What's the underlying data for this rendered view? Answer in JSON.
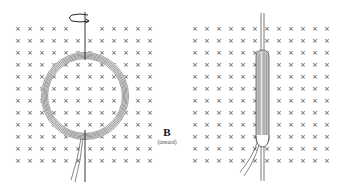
{
  "field": {
    "symbol": "B",
    "direction_label": "(inward)",
    "mark_glyph": "×",
    "mark_color": "#444444"
  },
  "left_panel": {
    "description": "circular coil face-on in field, rotating about vertical axis",
    "grid": {
      "cols": 12,
      "rows": 12,
      "x0": 18,
      "y0": 28,
      "dx": 12,
      "dy": 12
    },
    "coil": {
      "cx": 85,
      "cy": 96,
      "r_outer": 43,
      "r_inner": 38
    },
    "rotation_arrow_icon": "rotation-arrow-icon"
  },
  "right_panel": {
    "description": "same coil edge-on after 90 degree rotation",
    "grid": {
      "cols": 12,
      "rows": 12,
      "x0": 195,
      "y0": 28,
      "dx": 12,
      "dy": 12
    },
    "coil_edge": {
      "x": 262,
      "y_top": 50,
      "y_bottom": 145
    }
  },
  "colors": {
    "line": "#333333",
    "coil_fill": "#bdbdbd",
    "background": "#ffffff"
  }
}
